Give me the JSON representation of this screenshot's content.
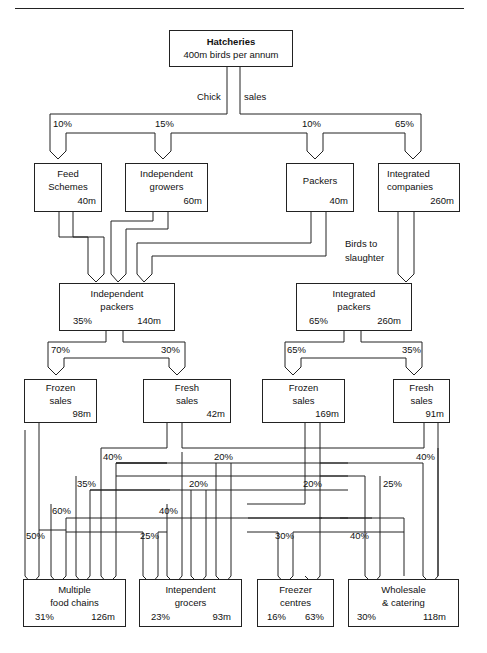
{
  "diagram": {
    "title_node": {
      "name": "Hatcheries",
      "subtitle": "400m birds per annum"
    },
    "flow_labels": {
      "chick": "Chick",
      "sales": "sales",
      "birds_to": "Birds to",
      "slaughter": "slaughter"
    },
    "tier1": [
      {
        "line1": "Feed",
        "line2": "Schemes",
        "value": "40m",
        "share": "10%"
      },
      {
        "line1": "Independent",
        "line2": "growers",
        "value": "60m",
        "share": "15%"
      },
      {
        "line1": "Packers",
        "line2": "",
        "value": "40m",
        "share": "10%"
      },
      {
        "line1": "Integrated",
        "line2": "companies",
        "value": "260m",
        "share": "65%"
      }
    ],
    "packers": [
      {
        "line1": "Independent",
        "line2": "packers",
        "pct": "35%",
        "value": "140m"
      },
      {
        "line1": "Integrated",
        "line2": "packers",
        "pct": "65%",
        "value": "260m"
      }
    ],
    "split_labels": {
      "indep_frozen": "70%",
      "indep_fresh": "30%",
      "integ_frozen": "65%",
      "integ_fresh": "35%"
    },
    "sales": [
      {
        "line1": "Frozen",
        "line2": "sales",
        "value": "98m"
      },
      {
        "line1": "Fresh",
        "line2": "sales",
        "value": "42m"
      },
      {
        "line1": "Frozen",
        "line2": "sales",
        "value": "169m"
      },
      {
        "line1": "Fresh",
        "line2": "sales",
        "value": "91m"
      }
    ],
    "route_labels": {
      "p40a": "40%",
      "p35": "35%",
      "p60": "60%",
      "p50": "50%",
      "p20a": "20%",
      "p20b": "20%",
      "p40b": "40%",
      "p25a": "25%",
      "p20c": "20%",
      "p25b": "25%",
      "p40c": "40%",
      "p30": "30%",
      "p40d": "40%"
    },
    "outlets": [
      {
        "line1": "Multiple",
        "line2": "food chains",
        "pct": "31%",
        "value": "126m"
      },
      {
        "line1": "Intependent",
        "line2": "grocers",
        "pct": "23%",
        "value": "93m"
      },
      {
        "line1": "Freezer",
        "line2": "centres",
        "pct": "16%",
        "value": "63%"
      },
      {
        "line1": "Wholesale",
        "line2": "& catering",
        "pct": "30%",
        "value": "118m"
      }
    ]
  }
}
